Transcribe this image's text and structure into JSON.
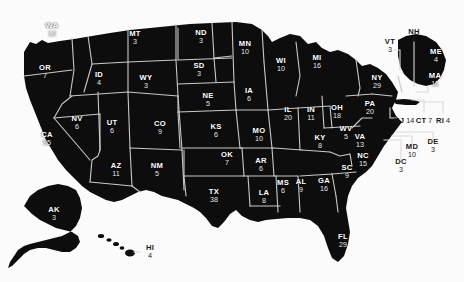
{
  "map": {
    "title": "United States Electoral College Map",
    "background_color": "#fbfbfb",
    "land_color": "#0d0d0d",
    "border_color": "#c9c9c9",
    "label_color": "#ffffff",
    "total_electoral_votes": 538
  },
  "chart_data": {
    "type": "map",
    "value_label": "Electoral Votes",
    "total": 538,
    "categories": [
      "WA",
      "OR",
      "CA",
      "NV",
      "ID",
      "MT",
      "WY",
      "UT",
      "AZ",
      "CO",
      "NM",
      "ND",
      "SD",
      "NE",
      "KS",
      "OK",
      "TX",
      "MN",
      "IA",
      "MO",
      "AR",
      "LA",
      "WI",
      "IL",
      "MS",
      "MI",
      "IN",
      "KY",
      "TN",
      "AL",
      "OH",
      "GA",
      "FL",
      "SC",
      "NC",
      "VA",
      "WV",
      "PA",
      "NY",
      "VT",
      "NH",
      "ME",
      "MA",
      "RI",
      "CT",
      "NJ",
      "DE",
      "MD",
      "DC",
      "AK",
      "HI"
    ],
    "values": [
      12,
      7,
      55,
      6,
      4,
      3,
      3,
      6,
      11,
      9,
      5,
      3,
      3,
      5,
      6,
      7,
      38,
      10,
      6,
      10,
      6,
      8,
      10,
      20,
      6,
      16,
      11,
      8,
      11,
      9,
      18,
      16,
      29,
      9,
      15,
      13,
      5,
      20,
      29,
      3,
      4,
      4,
      11,
      4,
      7,
      14,
      3,
      10,
      3,
      3,
      4
    ]
  },
  "states": [
    {
      "id": "WA",
      "abbr": "WA",
      "votes": "12",
      "x": 52,
      "y": 30
    },
    {
      "id": "OR",
      "abbr": "OR",
      "votes": "7",
      "x": 45,
      "y": 72
    },
    {
      "id": "CA",
      "abbr": "CA",
      "votes": "55",
      "x": 47,
      "y": 139
    },
    {
      "id": "NV",
      "abbr": "NV",
      "votes": "6",
      "x": 77,
      "y": 123
    },
    {
      "id": "ID",
      "abbr": "ID",
      "votes": "4",
      "x": 99,
      "y": 79
    },
    {
      "id": "MT",
      "abbr": "MT",
      "votes": "3",
      "x": 135,
      "y": 38
    },
    {
      "id": "WY",
      "abbr": "WY",
      "votes": "3",
      "x": 146,
      "y": 82
    },
    {
      "id": "UT",
      "abbr": "UT",
      "votes": "6",
      "x": 112,
      "y": 127
    },
    {
      "id": "AZ",
      "abbr": "AZ",
      "votes": "11",
      "x": 116,
      "y": 170
    },
    {
      "id": "CO",
      "abbr": "CO",
      "votes": "9",
      "x": 160,
      "y": 128
    },
    {
      "id": "NM",
      "abbr": "NM",
      "votes": "5",
      "x": 157,
      "y": 170
    },
    {
      "id": "ND",
      "abbr": "ND",
      "votes": "3",
      "x": 201,
      "y": 37
    },
    {
      "id": "SD",
      "abbr": "SD",
      "votes": "3",
      "x": 199,
      "y": 70
    },
    {
      "id": "NE",
      "abbr": "NE",
      "votes": "5",
      "x": 208,
      "y": 100
    },
    {
      "id": "KS",
      "abbr": "KS",
      "votes": "6",
      "x": 216,
      "y": 131
    },
    {
      "id": "OK",
      "abbr": "OK",
      "votes": "7",
      "x": 227,
      "y": 159
    },
    {
      "id": "TX",
      "abbr": "TX",
      "votes": "38",
      "x": 214,
      "y": 196
    },
    {
      "id": "MN",
      "abbr": "MN",
      "votes": "10",
      "x": 245,
      "y": 48
    },
    {
      "id": "IA",
      "abbr": "IA",
      "votes": "6",
      "x": 249,
      "y": 95
    },
    {
      "id": "MO",
      "abbr": "MO",
      "votes": "10",
      "x": 259,
      "y": 135
    },
    {
      "id": "AR",
      "abbr": "AR",
      "votes": "6",
      "x": 261,
      "y": 165
    },
    {
      "id": "LA",
      "abbr": "LA",
      "votes": "8",
      "x": 264,
      "y": 197
    },
    {
      "id": "WI",
      "abbr": "WI",
      "votes": "10",
      "x": 281,
      "y": 65
    },
    {
      "id": "IL",
      "abbr": "IL",
      "votes": "20",
      "x": 288,
      "y": 114
    },
    {
      "id": "MS",
      "abbr": "MS",
      "votes": "6",
      "x": 283,
      "y": 187
    },
    {
      "id": "MI",
      "abbr": "MI",
      "votes": "16",
      "x": 317,
      "y": 62
    },
    {
      "id": "IN",
      "abbr": "IN",
      "votes": "11",
      "x": 311,
      "y": 114
    },
    {
      "id": "KY",
      "abbr": "KY",
      "votes": "8",
      "x": 320,
      "y": 142
    },
    {
      "id": "AL",
      "abbr": "AL",
      "votes": "9",
      "x": 301,
      "y": 186
    },
    {
      "id": "OH",
      "abbr": "OH",
      "votes": "18",
      "x": 337,
      "y": 112
    },
    {
      "id": "GA",
      "abbr": "GA",
      "votes": "16",
      "x": 324,
      "y": 185
    },
    {
      "id": "FL",
      "abbr": "FL",
      "votes": "29",
      "x": 343,
      "y": 241
    },
    {
      "id": "SC",
      "abbr": "SC",
      "votes": "9",
      "x": 347,
      "y": 172
    },
    {
      "id": "NC",
      "abbr": "NC",
      "votes": "15",
      "x": 363,
      "y": 160
    },
    {
      "id": "VA",
      "abbr": "VA",
      "votes": "13",
      "x": 360,
      "y": 141
    },
    {
      "id": "WV",
      "abbr": "WV",
      "votes": "5",
      "x": 346,
      "y": 133
    },
    {
      "id": "PA",
      "abbr": "PA",
      "votes": "20",
      "x": 370,
      "y": 108
    },
    {
      "id": "NY",
      "abbr": "NY",
      "votes": "29",
      "x": 377,
      "y": 82
    },
    {
      "id": "VT",
      "abbr": "VT",
      "votes": "3",
      "x": 390,
      "y": 46
    },
    {
      "id": "NH",
      "abbr": "NH",
      "votes": "4",
      "x": 414,
      "y": 36
    },
    {
      "id": "ME",
      "abbr": "ME",
      "votes": "4",
      "x": 436,
      "y": 56
    },
    {
      "id": "MA",
      "abbr": "MA",
      "votes": "11",
      "x": 435,
      "y": 80
    },
    {
      "id": "RI",
      "abbr": "RI",
      "votes": "4",
      "x": 443,
      "y": 118
    },
    {
      "id": "CT",
      "abbr": "CT",
      "votes": "7",
      "x": 424,
      "y": 118
    },
    {
      "id": "NJ",
      "abbr": "NJ",
      "votes": "14",
      "x": 404,
      "y": 118
    },
    {
      "id": "DE",
      "abbr": "DE",
      "votes": "3",
      "x": 433,
      "y": 146
    },
    {
      "id": "MD",
      "abbr": "MD",
      "votes": "10",
      "x": 412,
      "y": 151
    },
    {
      "id": "DC",
      "abbr": "DC",
      "votes": "3",
      "x": 401,
      "y": 166
    },
    {
      "id": "AK",
      "abbr": "AK",
      "votes": "3",
      "x": 54,
      "y": 214
    },
    {
      "id": "HI",
      "abbr": "HI",
      "votes": "4",
      "x": 150,
      "y": 252
    }
  ]
}
